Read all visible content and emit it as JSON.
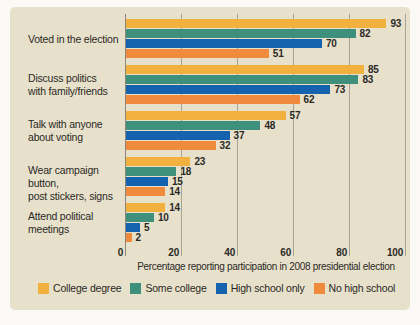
{
  "page": {
    "background": "#FAF9F5",
    "panel_color": "#E7E1CC",
    "gridline_color": "#A9A394",
    "axis_line_color": "#8C8678",
    "text_color": "#2B2925"
  },
  "chart_data": {
    "type": "bar",
    "orientation": "horizontal",
    "title": "",
    "xlabel": "Percentage reporting participation in 2008 presidential election",
    "ylabel": "",
    "xlim": [
      0,
      100
    ],
    "xticks": [
      0,
      20,
      40,
      60,
      80,
      100
    ],
    "grid": true,
    "legend_position": "bottom",
    "categories": [
      [
        "Voted in the election"
      ],
      [
        "Discuss politics",
        "with family/friends"
      ],
      [
        "Talk with anyone",
        "about voting"
      ],
      [
        "Wear campaign button,",
        "post stickers, signs"
      ],
      [
        "Attend political",
        "meetings"
      ]
    ],
    "series": [
      {
        "name": "College degree",
        "color": "#F2B13E",
        "values": [
          93,
          85,
          57,
          23,
          14
        ]
      },
      {
        "name": "Some college",
        "color": "#3F8F7D",
        "values": [
          82,
          83,
          48,
          18,
          10
        ]
      },
      {
        "name": "High school only",
        "color": "#1562AF",
        "values": [
          70,
          73,
          37,
          15,
          5
        ]
      },
      {
        "name": "No high school",
        "color": "#F08A3C",
        "values": [
          51,
          62,
          32,
          14,
          2
        ]
      }
    ]
  }
}
